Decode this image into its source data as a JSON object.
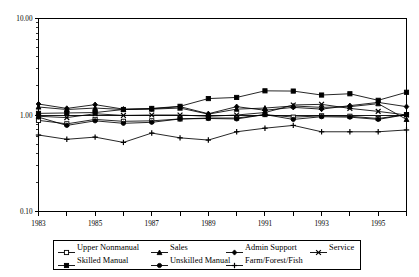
{
  "chart_data": {
    "type": "line",
    "title": "",
    "xlabel": "",
    "ylabel": "",
    "yscale": "log",
    "ylim": [
      0.1,
      10.0
    ],
    "xlim": [
      1983,
      1996
    ],
    "grid": false,
    "reference_line": 1.0,
    "legend_position": "bottom",
    "y_tick_labels": [
      "10.00",
      "1.00",
      "0.10"
    ],
    "y_tick_values": [
      10.0,
      1.0,
      0.1
    ],
    "x_tick_labels": [
      "1983",
      "1985",
      "1987",
      "1989",
      "1991",
      "1993",
      "1995"
    ],
    "x_tick_values": [
      1983,
      1985,
      1987,
      1989,
      1991,
      1993,
      1995
    ],
    "x": [
      1983,
      1984,
      1985,
      1986,
      1987,
      1988,
      1989,
      1990,
      1991,
      1992,
      1993,
      1994,
      1995,
      1996
    ],
    "series": [
      {
        "name": "Upper Nonmanual",
        "marker": "open-square",
        "values": [
          0.88,
          0.81,
          0.9,
          0.86,
          0.87,
          0.91,
          0.93,
          0.93,
          1.01,
          0.95,
          0.98,
          0.97,
          0.92,
          1.01
        ]
      },
      {
        "name": "Sales",
        "marker": "filled-triangle",
        "values": [
          1.21,
          1.14,
          1.18,
          1.14,
          1.15,
          1.18,
          1.02,
          1.15,
          1.18,
          1.24,
          1.2,
          1.22,
          1.31,
          0.9
        ]
      },
      {
        "name": "Admin Support",
        "marker": "filled-diamond",
        "values": [
          1.3,
          1.17,
          1.28,
          1.15,
          1.16,
          1.22,
          1.03,
          1.22,
          1.12,
          1.2,
          1.15,
          1.25,
          1.35,
          1.22
        ]
      },
      {
        "name": "Service",
        "marker": "cross-x",
        "values": [
          0.97,
          0.94,
          1.03,
          0.99,
          1.0,
          1.0,
          0.97,
          1.0,
          1.06,
          1.27,
          1.29,
          1.17,
          1.09,
          1.0
        ]
      },
      {
        "name": "Skilled Manual",
        "marker": "filled-square",
        "values": [
          1.04,
          1.05,
          1.06,
          1.14,
          1.17,
          1.23,
          1.48,
          1.52,
          1.78,
          1.77,
          1.61,
          1.66,
          1.42,
          1.72
        ]
      },
      {
        "name": "Unskilled Manual",
        "marker": "filled-circle",
        "values": [
          0.95,
          0.78,
          0.87,
          0.82,
          0.84,
          0.91,
          0.92,
          0.91,
          1.01,
          0.9,
          0.96,
          0.95,
          0.9,
          1.01
        ]
      },
      {
        "name": "Farm/Forest/Fish",
        "marker": "plus",
        "values": [
          0.62,
          0.56,
          0.59,
          0.52,
          0.65,
          0.58,
          0.55,
          0.67,
          0.73,
          0.78,
          0.67,
          0.67,
          0.67,
          0.7
        ]
      }
    ]
  },
  "legend": {
    "rows": [
      [
        {
          "label": "Upper Nonmanual",
          "marker": "open-square"
        },
        {
          "label": "Sales",
          "marker": "filled-triangle"
        },
        {
          "label": "Admin Support",
          "marker": "filled-diamond"
        },
        {
          "label": "Service",
          "marker": "cross-x"
        }
      ],
      [
        {
          "label": "Skilled Manual",
          "marker": "filled-square"
        },
        {
          "label": "Unskilled Manual",
          "marker": "filled-circle"
        },
        {
          "label": "Farm/Forest/Fish",
          "marker": "plus"
        }
      ]
    ]
  }
}
